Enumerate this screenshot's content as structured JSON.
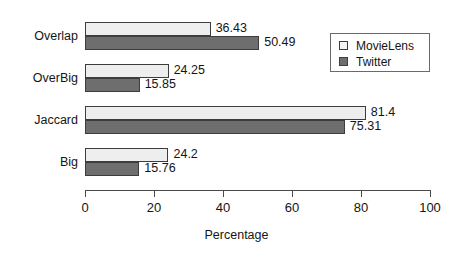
{
  "chart_data": {
    "type": "bar",
    "orientation": "horizontal",
    "title": "",
    "xlabel": "Percentage",
    "ylabel": "",
    "xlim": [
      0,
      100
    ],
    "xticks": [
      0,
      20,
      40,
      60,
      80,
      100
    ],
    "categories": [
      "Overlap",
      "OverBig",
      "Jaccard",
      "Big"
    ],
    "grid": false,
    "legend_position": "top-right",
    "series": [
      {
        "name": "MovieLens",
        "color": "#eeeeee",
        "values": [
          36.43,
          24.25,
          81.4,
          24.2
        ],
        "labels": [
          "36.43",
          "24.25",
          "81.4",
          "24.2"
        ]
      },
      {
        "name": "Twitter",
        "color": "#6e6e6e",
        "values": [
          50.49,
          15.85,
          75.31,
          15.76
        ],
        "labels": [
          "50.49",
          "15.85",
          "75.31",
          "15.76"
        ]
      }
    ]
  },
  "axis": {
    "x_tick_labels": [
      "0",
      "20",
      "40",
      "60",
      "80",
      "100"
    ],
    "x_title": "Percentage"
  },
  "legend": {
    "entries": [
      {
        "label": "MovieLens"
      },
      {
        "label": "Twitter"
      }
    ]
  },
  "colors": {
    "series_movielens": "#eeeeee",
    "series_twitter": "#6e6e6e",
    "axis": "#4a4a4a",
    "text": "#151515",
    "background": "#ffffff"
  }
}
